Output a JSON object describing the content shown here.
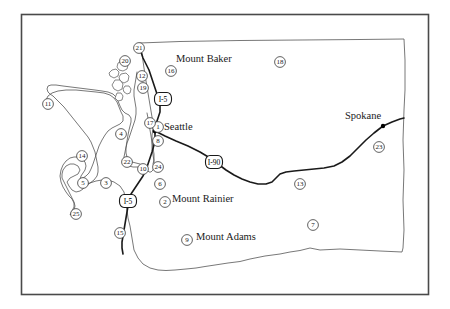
{
  "figure": {
    "background_color": "#ffffff",
    "frame_color": "#4a4a4a",
    "outline_color": "#555555",
    "highway_color": "#1a1a1a"
  },
  "place_labels": [
    {
      "name": "mount-baker",
      "text": "Mount Baker",
      "x": 176,
      "y": 62
    },
    {
      "name": "mount-rainier",
      "text": "Mount Rainier",
      "x": 172,
      "y": 202
    },
    {
      "name": "mount-adams",
      "text": "Mount Adams",
      "x": 196,
      "y": 240
    }
  ],
  "cities": [
    {
      "name": "seattle",
      "text": "Seattle",
      "label_x": 164,
      "label_y": 130,
      "dot_x": 155,
      "dot_y": 131
    },
    {
      "name": "spokane",
      "text": "Spokane",
      "label_x": 345,
      "label_y": 119,
      "dot_x": 383,
      "dot_y": 126
    }
  ],
  "highway_shields": [
    {
      "name": "shield-i5-north",
      "text": "I-5",
      "x": 163,
      "y": 99
    },
    {
      "name": "shield-i5-south",
      "text": "I-5",
      "x": 128,
      "y": 201
    },
    {
      "name": "shield-i90",
      "text": "I-90",
      "x": 214,
      "y": 162
    }
  ],
  "numbered_markers": [
    {
      "name": "marker-1",
      "text": "1",
      "x": 158,
      "y": 127
    },
    {
      "name": "marker-2",
      "text": "2",
      "x": 165,
      "y": 202
    },
    {
      "name": "marker-3",
      "text": "3",
      "x": 106,
      "y": 183
    },
    {
      "name": "marker-4",
      "text": "4",
      "x": 121,
      "y": 134
    },
    {
      "name": "marker-5",
      "text": "5",
      "x": 83,
      "y": 183
    },
    {
      "name": "marker-6",
      "text": "6",
      "x": 160,
      "y": 184
    },
    {
      "name": "marker-7",
      "text": "7",
      "x": 313,
      "y": 225
    },
    {
      "name": "marker-8",
      "text": "8",
      "x": 158,
      "y": 141
    },
    {
      "name": "marker-9",
      "text": "9",
      "x": 187,
      "y": 240
    },
    {
      "name": "marker-10",
      "text": "10",
      "x": 143,
      "y": 169
    },
    {
      "name": "marker-11",
      "text": "11",
      "x": 48,
      "y": 104
    },
    {
      "name": "marker-12",
      "text": "12",
      "x": 142,
      "y": 76
    },
    {
      "name": "marker-13",
      "text": "13",
      "x": 300,
      "y": 184
    },
    {
      "name": "marker-14",
      "text": "14",
      "x": 82,
      "y": 156
    },
    {
      "name": "marker-15",
      "text": "15",
      "x": 120,
      "y": 233
    },
    {
      "name": "marker-16",
      "text": "16",
      "x": 171,
      "y": 71
    },
    {
      "name": "marker-17",
      "text": "17",
      "x": 150,
      "y": 123
    },
    {
      "name": "marker-18",
      "text": "18",
      "x": 280,
      "y": 62
    },
    {
      "name": "marker-19",
      "text": "19",
      "x": 143,
      "y": 88
    },
    {
      "name": "marker-20",
      "text": "20",
      "x": 125,
      "y": 61
    },
    {
      "name": "marker-21",
      "text": "21",
      "x": 139,
      "y": 48
    },
    {
      "name": "marker-22",
      "text": "22",
      "x": 127,
      "y": 162
    },
    {
      "name": "marker-23",
      "text": "23",
      "x": 379,
      "y": 147
    },
    {
      "name": "marker-24",
      "text": "24",
      "x": 158,
      "y": 167
    },
    {
      "name": "marker-25",
      "text": "25",
      "x": 76,
      "y": 214
    }
  ]
}
